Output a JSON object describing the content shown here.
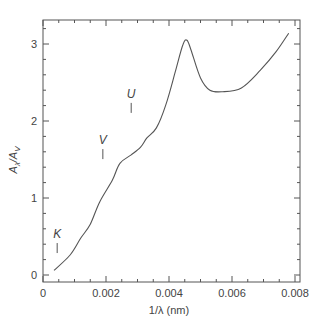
{
  "chart_data": {
    "type": "line",
    "title": "",
    "xlabel": "1/λ (nm)",
    "ylabel": "Aλ/AV",
    "xlim": [
      0,
      0.0081
    ],
    "ylim": [
      -0.05,
      3.3
    ],
    "grid": false,
    "legend": null,
    "x_ticks": [
      0,
      0.002,
      0.004,
      0.006,
      0.008
    ],
    "x_tick_labels": [
      "0",
      "0.002",
      "0.004",
      "0.006",
      "0.008"
    ],
    "y_ticks": [
      0,
      1,
      2,
      3
    ],
    "y_tick_labels": [
      "0",
      "1",
      "2",
      "3"
    ],
    "series": [
      {
        "name": "extinction curve",
        "x": [
          0.00035,
          0.00086,
          0.0012,
          0.0015,
          0.0018,
          0.0022,
          0.00244,
          0.0028,
          0.0031,
          0.0033,
          0.0036,
          0.0039,
          0.0042,
          0.00444,
          0.00457,
          0.0047,
          0.005,
          0.0053,
          0.0057,
          0.0063,
          0.0069,
          0.0074,
          0.0078
        ],
        "y": [
          0.06,
          0.26,
          0.48,
          0.66,
          0.95,
          1.23,
          1.45,
          1.56,
          1.66,
          1.78,
          1.91,
          2.21,
          2.64,
          2.99,
          3.05,
          2.92,
          2.56,
          2.4,
          2.38,
          2.43,
          2.66,
          2.9,
          3.14
        ]
      }
    ],
    "annotations": [
      {
        "text": "K",
        "x": 0.00045,
        "y": 0.48
      },
      {
        "text": "V",
        "x": 0.0019,
        "y": 1.7
      },
      {
        "text": "U",
        "x": 0.0028,
        "y": 2.3
      }
    ]
  },
  "labels": {
    "xlabel": "1/λ (nm)",
    "ylabel_main": "A",
    "ylabel_sub1": "λ",
    "ylabel_mid": "/A",
    "ylabel_sub2": "V",
    "band_k": "K",
    "band_v": "V",
    "band_u": "U"
  },
  "colors": {
    "line": "#555555",
    "axis": "#555555"
  }
}
